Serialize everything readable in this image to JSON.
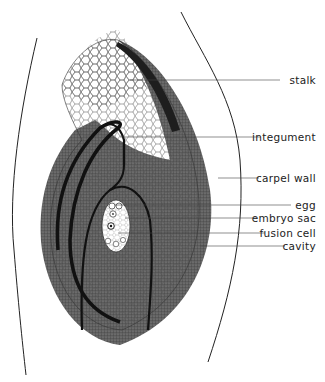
{
  "diagram": {
    "labels": [
      {
        "id": "stalk",
        "text": "stalk",
        "y": 80
      },
      {
        "id": "integument",
        "text": "integument",
        "y": 137
      },
      {
        "id": "carpel-wall",
        "text": "carpel wall",
        "y": 178
      },
      {
        "id": "egg",
        "text": "egg",
        "y": 205
      },
      {
        "id": "embryo-sac",
        "text": "embryo sac",
        "y": 218
      },
      {
        "id": "fusion-cell",
        "text": "fusion cell",
        "y": 233
      },
      {
        "id": "cavity",
        "text": "cavity",
        "y": 246
      }
    ],
    "colors": {
      "line": "#222222",
      "background": "#ffffff",
      "shading": "#333333"
    }
  }
}
